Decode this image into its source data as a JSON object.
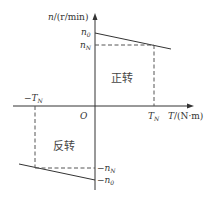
{
  "diagram": {
    "type": "motor mechanical characteristic (n-T)",
    "y_axis": {
      "label": "n/(r/min)"
    },
    "x_axis": {
      "label": "T/(N·m)"
    },
    "origin": "O",
    "ticks": {
      "n0": "n",
      "n0_sub": "0",
      "nN": "n",
      "nN_sub": "N",
      "neg_nN": "−n",
      "neg_nN_sub": "N",
      "neg_n0": "−n",
      "neg_n0_sub": "0",
      "TN": "T",
      "TN_sub": "N",
      "neg_TN": "−T",
      "neg_TN_sub": "N"
    },
    "regions": {
      "forward": "正转",
      "reverse": "反转"
    },
    "colors": {
      "line": "#333333",
      "dashed": "#555555",
      "background": "#ffffff"
    }
  }
}
